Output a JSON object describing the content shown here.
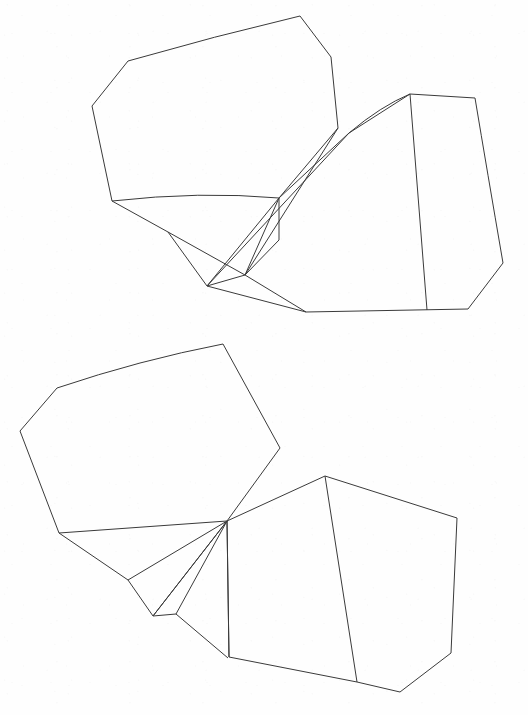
{
  "document": {
    "kind": "line-drawing",
    "title": "Two crystal habit line drawings",
    "background_color": "#fefefe",
    "stroke_color": "#3a3a3a",
    "stroke_width": 1,
    "width": 528,
    "height": 715
  },
  "figures": [
    {
      "id": "upper-figure",
      "label": "Upper crystal drawing",
      "shapes": [
        {
          "name": "upper-left-crystal-outline",
          "kind": "closed",
          "d": "M 300 16 L 331 57 L 338 128 L 279 198 L 207 286 L 168 232 L 112 201 L 92 106 L 128 61 Q 215 36 300 16 Z"
        },
        {
          "name": "upper-left-front-face-edge",
          "kind": "open",
          "d": "M 338 128 L 245 275 L 207 286"
        },
        {
          "name": "upper-left-curved-girdle",
          "kind": "open",
          "d": "M 112 201 Q 200 191 279 198"
        },
        {
          "name": "upper-left-lower-facet-edge",
          "kind": "open",
          "d": "M 168 232 L 245 275"
        },
        {
          "name": "upper-right-crystal-outline",
          "kind": "closed",
          "d": "M 410 94 L 475 98 Q 487 170 503 263 L 468 309 L 306 312 L 245 275 L 279 198 L 349 133 Z"
        },
        {
          "name": "upper-right-inner-diagonal",
          "kind": "open",
          "d": "M 410 94 L 427 310"
        },
        {
          "name": "upper-right-curved-prism-edge",
          "kind": "open",
          "d": "M 349 133 Q 381 106 410 94"
        },
        {
          "name": "upper-right-vertical-seam",
          "kind": "open",
          "d": "M 279 198 L 279 240 L 245 275"
        },
        {
          "name": "upper-right-long-prism-edge",
          "kind": "open",
          "d": "M 349 133 L 207 286"
        },
        {
          "name": "upper-right-prism-base-edge",
          "kind": "open",
          "d": "M 207 286 L 306 312"
        }
      ]
    },
    {
      "id": "lower-figure",
      "label": "Lower crystal drawing",
      "shapes": [
        {
          "name": "lower-left-crystal-outline",
          "kind": "closed",
          "d": "M 223 344 L 280 448 L 227 521 L 153 616 L 128 580 L 59 533 L 20 431 L 57 388 Q 140 360 223 344 Z"
        },
        {
          "name": "lower-left-girdle-edge",
          "kind": "open",
          "d": "M 59 533 L 227 521"
        },
        {
          "name": "lower-left-facet-ray-a",
          "kind": "open",
          "d": "M 227 521 L 128 580"
        },
        {
          "name": "lower-left-facet-ray-b",
          "kind": "open",
          "d": "M 227 521 L 153 616"
        },
        {
          "name": "lower-left-facet-ray-c",
          "kind": "open",
          "d": "M 227 521 L 176 614"
        },
        {
          "name": "lower-left-lower-facet-edge",
          "kind": "open",
          "d": "M 153 616 L 176 614"
        },
        {
          "name": "lower-left-base-edge",
          "kind": "open",
          "d": "M 176 614 L 228 658"
        },
        {
          "name": "lower-right-crystal-outline",
          "kind": "closed",
          "d": "M 325 476 L 457 518 L 451 653 L 400 692 L 357 682 L 229 657 L 227 521 Z"
        },
        {
          "name": "lower-right-inner-diagonal",
          "kind": "open",
          "d": "M 325 476 L 357 682"
        },
        {
          "name": "lower-right-hub-vertical",
          "kind": "open",
          "d": "M 227 521 L 229 657"
        }
      ]
    }
  ]
}
